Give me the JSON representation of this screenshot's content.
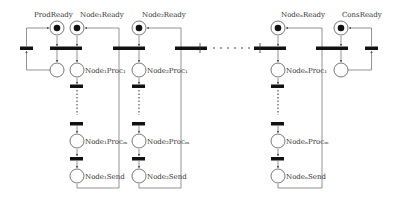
{
  "diagram": {
    "type": "petri-net",
    "labels": {
      "prod_ready": "ProdReady",
      "node1_ready": "Node₁Ready",
      "node2_ready": "Node₂Ready",
      "noden_ready": "NodeₙReady",
      "cons_ready": "ConsReady",
      "node1_proc1": "Node₁Proc₁",
      "node2_proc1": "Node₂Proc₁",
      "noden_proc1": "NodeₙProc₁",
      "node1_procm": "Node₁Procₘ",
      "node2_procm": "Node₂Procₘ",
      "noden_procm": "NodeₙProcₘ",
      "node1_send": "Node₁Send",
      "node2_send": "Node₂Send",
      "noden_send": "NodeₙSend"
    },
    "colors": {
      "line": "#666666",
      "token": "#111111",
      "transition": "#111111",
      "text": "#333333"
    }
  }
}
